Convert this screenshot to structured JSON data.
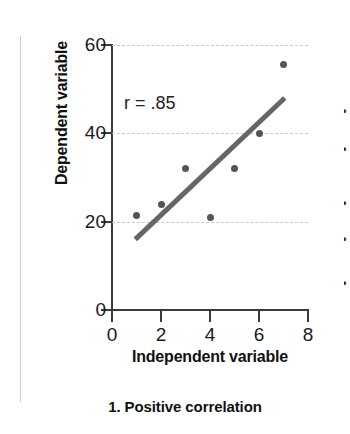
{
  "figure": {
    "caption": "1. Positive correlation",
    "annotation": "r = .85",
    "divider_color": "#cccccc"
  },
  "right_clip": {
    "fragments": [
      "•",
      "•",
      "•",
      "•",
      "•"
    ]
  },
  "chart_data": {
    "type": "scatter",
    "title": "",
    "subtitle": "",
    "xlabel": "Independent variable",
    "ylabel": "Dependent variable",
    "xlim": [
      0,
      8
    ],
    "ylim": [
      0,
      60
    ],
    "xticks": [
      0,
      2,
      4,
      6,
      8
    ],
    "yticks": [
      0,
      20,
      40,
      60
    ],
    "xtick_labels": [
      "0",
      "2",
      "4",
      "6",
      "8"
    ],
    "ytick_labels": [
      "0",
      "20",
      "40",
      "60"
    ],
    "grid": "horizontal-dashed",
    "gridlines_y": [
      20,
      40,
      60
    ],
    "legend": "none",
    "annotations": [
      {
        "text": "r = .85",
        "x": 0.6,
        "y": 44
      }
    ],
    "point_color": "#555555",
    "trendline_color": "#666666",
    "series": [
      {
        "name": "observations",
        "marker": "circle",
        "x": [
          1,
          2,
          3,
          4,
          5,
          6,
          7
        ],
        "y": [
          21.5,
          24,
          32,
          21,
          32,
          40,
          55.5
        ]
      }
    ],
    "trendline": {
      "type": "linear-fit",
      "x": [
        0.95,
        7.05
      ],
      "y": [
        16,
        48
      ],
      "correlation_r": 0.85
    }
  }
}
